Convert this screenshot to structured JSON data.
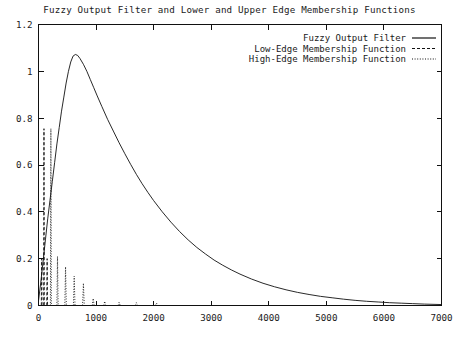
{
  "chart_data": {
    "type": "line",
    "title": "Fuzzy Output Filter and Lower and Upper Edge Membership Functions",
    "xlabel": "",
    "ylabel": "",
    "xlim": [
      0,
      7000
    ],
    "ylim": [
      0,
      1.2
    ],
    "xticks": [
      0,
      1000,
      2000,
      3000,
      4000,
      5000,
      6000,
      7000
    ],
    "xtick_labels": [
      "0",
      "1000",
      "2000",
      "3000",
      "4000",
      "5000",
      "6000",
      "7000"
    ],
    "yticks": [
      0,
      0.2,
      0.4,
      0.6,
      0.8,
      1,
      1.2
    ],
    "ytick_labels": [
      "0",
      "0.2",
      "0.4",
      "0.6",
      "0.8",
      "1",
      "1.2"
    ],
    "grid": false,
    "legend_position": "top-right",
    "series": [
      {
        "name": "Fuzzy Output Filter",
        "style": "solid",
        "color": "#111111",
        "peak_x": 600,
        "peak_y": 1.07,
        "points": [
          [
            0,
            0.02
          ],
          [
            40,
            0.1
          ],
          [
            80,
            0.19
          ],
          [
            120,
            0.28
          ],
          [
            160,
            0.37
          ],
          [
            200,
            0.45
          ],
          [
            240,
            0.53
          ],
          [
            280,
            0.61
          ],
          [
            320,
            0.69
          ],
          [
            360,
            0.76
          ],
          [
            400,
            0.83
          ],
          [
            440,
            0.89
          ],
          [
            480,
            0.95
          ],
          [
            520,
            1.0
          ],
          [
            560,
            1.04
          ],
          [
            600,
            1.065
          ],
          [
            640,
            1.072
          ],
          [
            680,
            1.068
          ],
          [
            720,
            1.055
          ],
          [
            780,
            1.03
          ],
          [
            840,
            1.0
          ],
          [
            900,
            0.965
          ],
          [
            960,
            0.93
          ],
          [
            1020,
            0.895
          ],
          [
            1100,
            0.85
          ],
          [
            1200,
            0.795
          ],
          [
            1300,
            0.745
          ],
          [
            1400,
            0.695
          ],
          [
            1500,
            0.648
          ],
          [
            1600,
            0.603
          ],
          [
            1700,
            0.56
          ],
          [
            1800,
            0.52
          ],
          [
            1900,
            0.483
          ],
          [
            2000,
            0.448
          ],
          [
            2150,
            0.4
          ],
          [
            2300,
            0.356
          ],
          [
            2450,
            0.316
          ],
          [
            2600,
            0.28
          ],
          [
            2750,
            0.248
          ],
          [
            2900,
            0.22
          ],
          [
            3050,
            0.194
          ],
          [
            3200,
            0.172
          ],
          [
            3350,
            0.152
          ],
          [
            3500,
            0.134
          ],
          [
            3700,
            0.113
          ],
          [
            3900,
            0.095
          ],
          [
            4100,
            0.08
          ],
          [
            4300,
            0.067
          ],
          [
            4500,
            0.056
          ],
          [
            4700,
            0.047
          ],
          [
            4900,
            0.039
          ],
          [
            5100,
            0.033
          ],
          [
            5300,
            0.027
          ],
          [
            5500,
            0.022
          ],
          [
            5700,
            0.018
          ],
          [
            5900,
            0.015
          ],
          [
            6100,
            0.012
          ],
          [
            6300,
            0.01
          ],
          [
            6500,
            0.008
          ],
          [
            6700,
            0.006
          ],
          [
            7000,
            0.004
          ]
        ]
      },
      {
        "name": "Low-Edge Membership Function",
        "style": "dashed",
        "color": "#111111",
        "spikes": [
          {
            "x": 55,
            "y": 0.2,
            "w": 12
          },
          {
            "x": 95,
            "y": 0.755,
            "w": 10
          },
          {
            "x": 150,
            "y": 0.2,
            "w": 14
          }
        ]
      },
      {
        "name": "High-Edge Membership Function",
        "style": "dotted",
        "color": "#111111",
        "spikes": [
          {
            "x": 215,
            "y": 0.755,
            "w": 16
          },
          {
            "x": 330,
            "y": 0.21,
            "w": 22
          },
          {
            "x": 470,
            "y": 0.165,
            "w": 26
          },
          {
            "x": 620,
            "y": 0.125,
            "w": 28
          },
          {
            "x": 780,
            "y": 0.095,
            "w": 30
          },
          {
            "x": 950,
            "y": 0.03,
            "w": 32
          },
          {
            "x": 1150,
            "y": 0.018,
            "w": 34
          },
          {
            "x": 1400,
            "y": 0.014,
            "w": 36
          },
          {
            "x": 1700,
            "y": 0.012,
            "w": 40
          },
          {
            "x": 2050,
            "y": 0.01,
            "w": 44
          }
        ]
      }
    ],
    "legend": [
      {
        "label": "Fuzzy Output Filter",
        "style": "solid"
      },
      {
        "label": "Low-Edge Membership Function",
        "style": "dashed"
      },
      {
        "label": "High-Edge Membership Function",
        "style": "dotted"
      }
    ]
  }
}
